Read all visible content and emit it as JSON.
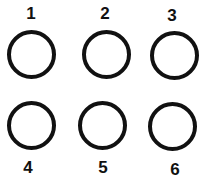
{
  "diagram": {
    "items": [
      {
        "label": "1"
      },
      {
        "label": "2"
      },
      {
        "label": "3"
      },
      {
        "label": "4"
      },
      {
        "label": "5"
      },
      {
        "label": "6"
      }
    ],
    "ring_color": "#111111",
    "background": "#ffffff"
  }
}
